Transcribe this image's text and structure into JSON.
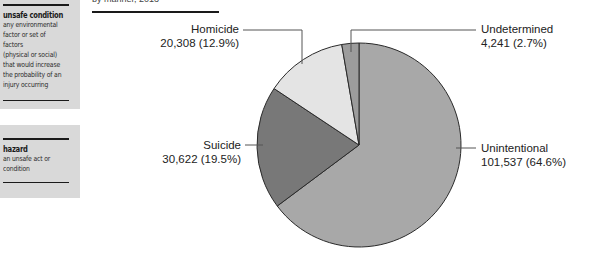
{
  "sidebar": {
    "boxes": [
      {
        "term": "unsafe condition",
        "definition": "any environmental\nfactor or set of factors\n(physical or social)\nthat would increase\nthe probability of an\ninjury occurring"
      },
      {
        "term": "hazard",
        "definition": "an unsafe act or\ncondition"
      }
    ]
  },
  "header": {
    "caption": "by manner, 2013"
  },
  "labels": {
    "homicide": {
      "name": "Homicide",
      "value": "20,308 (12.9%)"
    },
    "undetermined": {
      "name": "Undetermined",
      "value": "4,241 (2.7%)"
    },
    "suicide": {
      "name": "Suicide",
      "value": "30,622 (19.5%)"
    },
    "unintentional": {
      "name": "Unintentional",
      "value": "101,537 (64.6%)"
    }
  },
  "colors": {
    "unintentional": "#a8a8a8",
    "suicide": "#787878",
    "homicide": "#e4e4e4",
    "undetermined": "#9c9c9c",
    "outline": "#2a2a2a",
    "sidebar_bg": "#d9d9d9"
  },
  "chart_data": {
    "type": "pie",
    "title": "",
    "categories": [
      "Unintentional",
      "Suicide",
      "Homicide",
      "Undetermined"
    ],
    "values": [
      101537,
      30622,
      20308,
      4241
    ],
    "percentages": [
      64.6,
      19.5,
      12.9,
      2.7
    ],
    "labels": [
      "101,537 (64.6%)",
      "30,622 (19.5%)",
      "20,308 (12.9%)",
      "4,241 (2.7%)"
    ],
    "start_angle": "12 o'clock",
    "direction": "clockwise",
    "legend": "none (leader-line labels)"
  }
}
